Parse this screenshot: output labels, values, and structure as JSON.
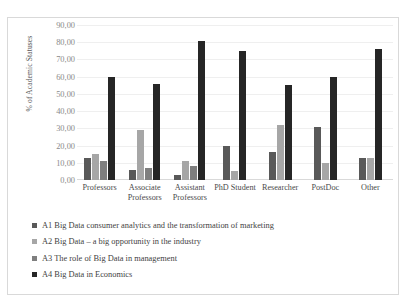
{
  "chart_data": {
    "type": "bar",
    "title": "",
    "xlabel": "",
    "ylabel": "% of Academic Statuses",
    "ylim": [
      0,
      90
    ],
    "ytick_labels": [
      "90,00",
      "80,00",
      "70,00",
      "60,00",
      "50,00",
      "40,00",
      "30,00",
      "20,00",
      "10,00",
      "0,00"
    ],
    "ytick_values": [
      90,
      80,
      70,
      60,
      50,
      40,
      30,
      20,
      10,
      0
    ],
    "grid": true,
    "legend_position": "bottom",
    "categories": [
      "Professors",
      "Associate Professors",
      "Assistant Professors",
      "PhD Student",
      "Researcher",
      "PostDoc",
      "Other"
    ],
    "series": [
      {
        "name": "A1 Big Data consumer analytics and the transformation of marketing",
        "color": "#595959",
        "values": [
          13,
          6,
          3,
          20,
          16,
          31,
          13
        ]
      },
      {
        "name": "A2 Big Data – a big opportunity in the industry",
        "color": "#a6a6a6",
        "values": [
          15,
          29,
          11,
          5,
          32,
          10,
          13
        ]
      },
      {
        "name": "A3 The role of Big Data in management",
        "color": "#7f7f7f",
        "values": [
          11,
          7,
          8,
          0,
          0,
          0,
          0
        ]
      },
      {
        "name": "A4 Big Data in Economics",
        "color": "#262626",
        "values": [
          60,
          56,
          81,
          75,
          55,
          60,
          76
        ]
      }
    ]
  }
}
